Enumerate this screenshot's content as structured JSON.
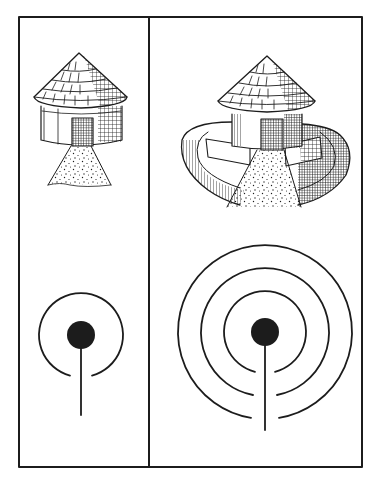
{
  "figure": {
    "colors": {
      "ink": "#1c1c1c",
      "paper": "#ffffff"
    },
    "frame": {
      "left": 19,
      "top": 17,
      "right": 362,
      "bottom": 467,
      "divider_x": 149
    },
    "panels": [
      {
        "id": "left",
        "illustration": "round-thatched-hut-with-path",
        "symbol": {
          "type": "concentric-open-rings",
          "center": [
            81,
            335
          ],
          "dot_radius": 14,
          "ring_radii": [
            42
          ],
          "stem_end_y": 415
        }
      },
      {
        "id": "right",
        "illustration": "round-thatched-hut-with-enclosure-wall-and-path",
        "symbol": {
          "type": "concentric-open-rings",
          "center": [
            265,
            332
          ],
          "dot_radius": 14,
          "ring_radii": [
            41,
            64,
            87
          ],
          "stem_end_y": 430
        }
      }
    ]
  }
}
